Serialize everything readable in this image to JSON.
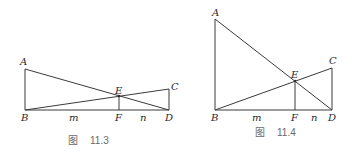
{
  "figures": [
    {
      "caption": {
        "prefix": "图",
        "number": "11.3"
      },
      "points": {
        "A": {
          "label": "A",
          "x": 25,
          "y": 69
        },
        "B": {
          "label": "B",
          "x": 25,
          "y": 110
        },
        "C": {
          "label": "C",
          "x": 169,
          "y": 89
        },
        "D": {
          "label": "D",
          "x": 169,
          "y": 110
        },
        "E": {
          "label": "E",
          "x": 119,
          "y": 96
        },
        "F": {
          "label": "F",
          "x": 119,
          "y": 110
        }
      },
      "segment_labels": {
        "m": "m",
        "n": "n"
      }
    },
    {
      "caption": {
        "prefix": "图",
        "number": "11.4"
      },
      "points": {
        "A": {
          "label": "A",
          "x": 215,
          "y": 19
        },
        "B": {
          "label": "B",
          "x": 215,
          "y": 110
        },
        "C": {
          "label": "C",
          "x": 332,
          "y": 68
        },
        "D": {
          "label": "D",
          "x": 332,
          "y": 110
        },
        "E": {
          "label": "E",
          "x": 295,
          "y": 81
        },
        "F": {
          "label": "F",
          "x": 295,
          "y": 110
        }
      },
      "segment_labels": {
        "m": "m",
        "n": "n"
      }
    }
  ],
  "colors": {
    "line": "#3a3a3a",
    "label": "#2a2a2a",
    "caption": "#6a6a6a"
  }
}
